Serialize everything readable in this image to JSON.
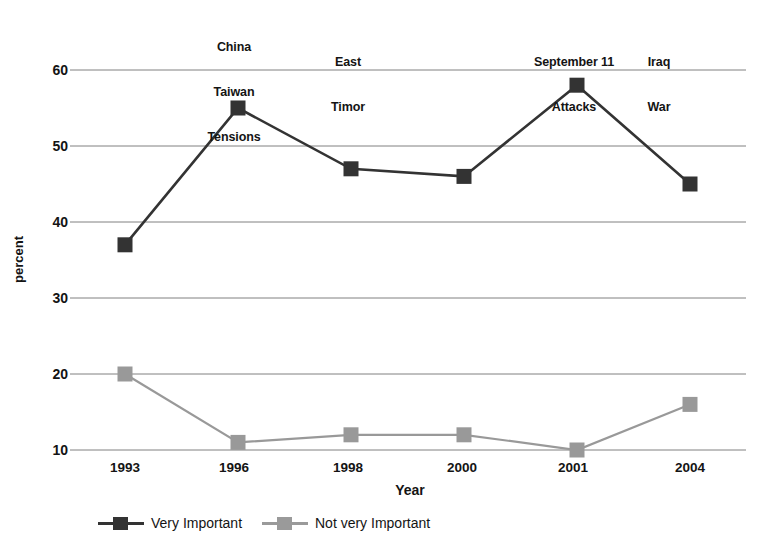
{
  "chart_data": {
    "type": "line",
    "title": "",
    "xlabel": "Year",
    "ylabel": "percent",
    "categories": [
      "1993",
      "1996",
      "1998",
      "2000",
      "2001",
      "2004"
    ],
    "ylim": [
      5,
      63
    ],
    "yticks": [
      10,
      20,
      30,
      40,
      50,
      60
    ],
    "grid": true,
    "legend_position": "bottom",
    "series": [
      {
        "name": "Very Important",
        "color": "#333333",
        "marker": "square",
        "values": [
          37,
          55,
          47,
          46,
          58,
          45
        ]
      },
      {
        "name": "Not very Important",
        "color": "#999999",
        "marker": "square",
        "values": [
          20,
          11,
          12,
          12,
          10,
          16
        ]
      }
    ],
    "annotations": [
      {
        "text": "China\nTaiwan\nTensions",
        "x_category": "1996"
      },
      {
        "text": "East\nTimor",
        "x_category": "1998"
      },
      {
        "text": "September 11\nAttacks",
        "x_category": "2001"
      },
      {
        "text": "Iraq\nWar",
        "x_category": "2004"
      }
    ]
  },
  "axis": {
    "y_tick_labels": [
      "60",
      "50",
      "40",
      "30",
      "20",
      "10"
    ],
    "x_tick_labels": [
      "1993",
      "1996",
      "1998",
      "2000",
      "2001",
      "2004"
    ],
    "y_axis_title": "percent",
    "x_axis_title": "Year"
  },
  "annotations": {
    "a0_l0": "China",
    "a0_l1": "Taiwan",
    "a0_l2": "Tensions",
    "a1_l0": "East",
    "a1_l1": "Timor",
    "a2_l0": "September 11",
    "a2_l1": "Attacks",
    "a3_l0": "Iraq",
    "a3_l1": "War"
  },
  "legend": {
    "items": [
      {
        "label": "Very Important",
        "color": "#333333"
      },
      {
        "label": "Not very Important",
        "color": "#999999"
      }
    ]
  },
  "colors": {
    "series_1": "#333333",
    "series_2": "#999999",
    "gridline": "#808080",
    "text": "#141414",
    "background": "#ffffff"
  }
}
